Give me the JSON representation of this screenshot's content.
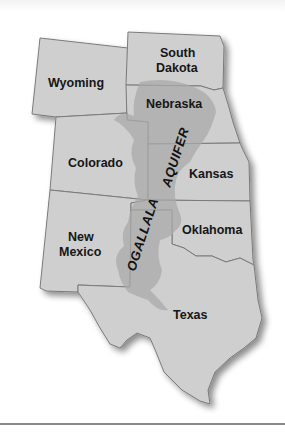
{
  "map": {
    "title_label": "OGALLALA AQUIFER",
    "aquifer_words": [
      "OGALLALA",
      "AQUIFER"
    ],
    "states": [
      {
        "name": "Wyoming",
        "lines": [
          "Wyoming"
        ]
      },
      {
        "name": "South Dakota",
        "lines": [
          "South",
          "Dakota"
        ]
      },
      {
        "name": "Nebraska",
        "lines": [
          "Nebraska"
        ]
      },
      {
        "name": "Colorado",
        "lines": [
          "Colorado"
        ]
      },
      {
        "name": "Kansas",
        "lines": [
          "Kansas"
        ]
      },
      {
        "name": "New Mexico",
        "lines": [
          "New",
          "Mexico"
        ]
      },
      {
        "name": "Oklahoma",
        "lines": [
          "Oklahoma"
        ]
      },
      {
        "name": "Texas",
        "lines": [
          "Texas"
        ]
      }
    ],
    "colors": {
      "state_fill": "#cfcfcf",
      "state_border": "#7a7a7a",
      "aquifer_fill": "#a9a9a9",
      "label_text": "#161616",
      "rule": "#8a8a8a"
    }
  }
}
